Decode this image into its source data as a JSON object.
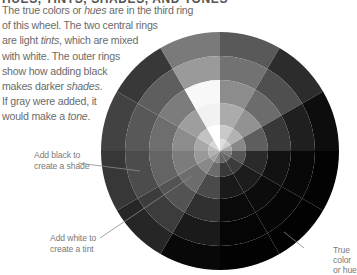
{
  "heading": "HUES, TINTS, SHADES, AND TONES",
  "intro": {
    "lines": [
      [
        {
          "t": "The true colors or "
        },
        {
          "t": "hues",
          "em": true
        },
        {
          "t": " are in the third ring"
        }
      ],
      [
        {
          "t": "of this wheel. The two central rings"
        }
      ],
      [
        {
          "t": "are light "
        },
        {
          "t": "tints",
          "em": true
        },
        {
          "t": ", which are mixed"
        }
      ],
      [
        {
          "t": "with white. The outer rings"
        }
      ],
      [
        {
          "t": "show how adding black"
        }
      ],
      [
        {
          "t": "makes darker "
        },
        {
          "t": "shades",
          "em": true
        },
        {
          "t": "."
        }
      ],
      [
        {
          "t": "If gray were added, it"
        }
      ],
      [
        {
          "t": "would make a "
        },
        {
          "t": "tone",
          "em": true
        },
        {
          "t": "."
        }
      ]
    ]
  },
  "annotations": {
    "shade": {
      "line1": "Add black to",
      "line2": "create a shade"
    },
    "tint": {
      "line1": "Add white to",
      "line2": "create a tint"
    },
    "hue": {
      "line1": "True",
      "line2": "color",
      "line3": "or hue"
    }
  },
  "wheel": {
    "center": [
      220,
      151
    ],
    "radii": [
      119,
      95,
      71,
      48,
      26,
      12
    ],
    "start_angle_deg": 0,
    "wedge_count": 12,
    "wedges": [
      {
        "rings": [
          "#595959",
          "#727272",
          "#8c8c8c",
          "#ababab",
          "#c9c9c9",
          "#dedede"
        ]
      },
      {
        "rings": [
          "#2c2c2c",
          "#4f4f4f",
          "#6c6c6c",
          "#929292",
          "#b2b2b2",
          "#cccccc"
        ]
      },
      {
        "rings": [
          "#0d0d0d",
          "#1f1f1f",
          "#383838",
          "#5e5e5e",
          "#888888",
          "#a8a8a8"
        ]
      },
      {
        "rings": [
          "#030303",
          "#080808",
          "#121212",
          "#2a2a2a",
          "#555555",
          "#7a7a7a"
        ]
      },
      {
        "rings": [
          "#020202",
          "#060606",
          "#0c0c0c",
          "#1c1c1c",
          "#3c3c3c",
          "#666666"
        ]
      },
      {
        "rings": [
          "#020202",
          "#050505",
          "#0a0a0a",
          "#1a1a1a",
          "#3a3a3a",
          "#646464"
        ]
      },
      {
        "rings": [
          "#080808",
          "#1a1a1a",
          "#303030",
          "#4a4a4a",
          "#6c6c6c",
          "#8a8a8a"
        ]
      },
      {
        "rings": [
          "#262626",
          "#3c3c3c",
          "#535353",
          "#6c6c6c",
          "#888888",
          "#a0a0a0"
        ]
      },
      {
        "rings": [
          "#373737",
          "#4c4c4c",
          "#646464",
          "#7c7c7c",
          "#999999",
          "#b0b0b0"
        ]
      },
      {
        "rings": [
          "#424242",
          "#585858",
          "#6e6e6e",
          "#8c8c8c",
          "#a8a8a8",
          "#bebebe"
        ]
      },
      {
        "rings": [
          "#383838",
          "#5e5e5e",
          "#7c7c7c",
          "#9e9e9e",
          "#c2c2c2",
          "#d8d8d8"
        ]
      },
      {
        "rings": [
          "#7a7a7a",
          "#9a9a9a",
          "#f8f8f8",
          "#f2f2f2",
          "#ffffff",
          "#ffffff"
        ]
      }
    ],
    "leader_lines": [
      {
        "from": [
          78,
          163
        ],
        "to": [
          140,
          171
        ]
      },
      {
        "from": [
          100,
          238
        ],
        "to": [
          192,
          176
        ]
      },
      {
        "from": [
          304,
          248
        ],
        "to": [
          284,
          232
        ]
      }
    ]
  }
}
